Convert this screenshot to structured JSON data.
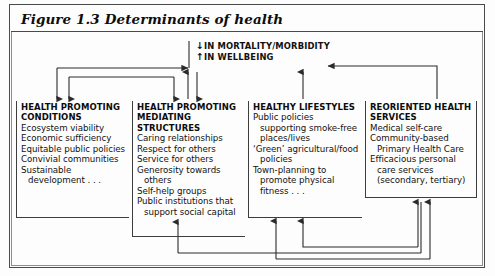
{
  "figure": {
    "title": "Figure 1.3 Determinants of health",
    "outcome": {
      "lines": [
        {
          "arrow": "↓",
          "arrow_name": "down-arrow-icon",
          "text": "IN MORTALITY/MORBIDITY"
        },
        {
          "arrow": "↑",
          "arrow_name": "up-arrow-icon",
          "text": "IN WELLBEING"
        }
      ]
    },
    "columns": [
      {
        "id": "health-promoting-conditions",
        "heading": "HEALTH PROMOTING\nCONDITIONS",
        "heading_lines": [
          "HEALTH PROMOTING",
          "CONDITIONS"
        ],
        "items": [
          "Ecosystem viability",
          "Economic sufficiency",
          "Equitable public policies",
          "Convivial communities",
          "Sustainable development . . ."
        ]
      },
      {
        "id": "health-promoting-mediating-structures",
        "heading": "HEALTH PROMOTING\nMEDIATING\nSTRUCTURES",
        "heading_lines": [
          "HEALTH PROMOTING",
          "MEDIATING",
          "STRUCTURES"
        ],
        "items": [
          "Caring relationships",
          "Respect for others",
          "Service for others",
          "Generosity towards others",
          "Self-help groups",
          "Public institutions that support social capital"
        ]
      },
      {
        "id": "healthy-lifestyles",
        "heading": "HEALTHY LIFESTYLES",
        "heading_lines": [
          "HEALTHY LIFESTYLES"
        ],
        "items": [
          "Public policies supporting smoke-free places/lives",
          "‘Green’ agricultural/food policies",
          "Town-planning to promote physical fitness . . ."
        ]
      },
      {
        "id": "reoriented-health-services",
        "heading": "REORIENTED HEALTH\nSERVICES",
        "heading_lines": [
          "REORIENTED HEALTH",
          "SERVICES"
        ],
        "items": [
          "Medical self-care",
          "Community-based Primary Health Care",
          "Efficacious personal care services (secondary, tertiary)"
        ]
      }
    ],
    "colors": {
      "frame": "#4a4a4a",
      "frame_inner": "#8d8d8d",
      "box_rule": "#3d3d3d",
      "wire": "#2b2b2b",
      "text": "#121212",
      "background": "#fdfdfd"
    }
  }
}
